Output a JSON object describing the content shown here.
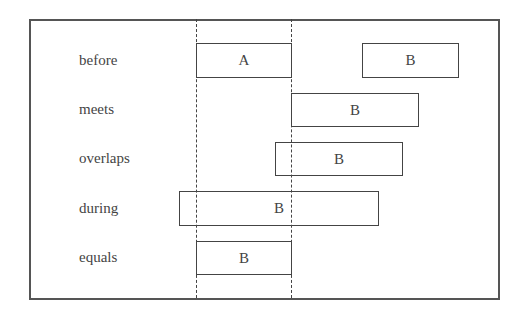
{
  "diagram": {
    "reference_interval": {
      "label": "A",
      "x_start": 196,
      "x_end": 291
    },
    "rows": [
      {
        "relation": "before",
        "boxes": [
          {
            "label": "A",
            "x": 196,
            "w": 95,
            "y": 43,
            "h": 34
          },
          {
            "label": "B",
            "x": 362,
            "w": 96,
            "y": 43,
            "h": 34
          }
        ]
      },
      {
        "relation": "meets",
        "boxes": [
          {
            "label": "B",
            "x": 291,
            "w": 127,
            "y": 93,
            "h": 33
          }
        ]
      },
      {
        "relation": "overlaps",
        "boxes": [
          {
            "label": "B",
            "x": 275,
            "w": 127,
            "y": 142,
            "h": 33
          }
        ]
      },
      {
        "relation": "during",
        "boxes": [
          {
            "label": "B",
            "x": 179,
            "w": 199,
            "y": 191,
            "h": 34
          }
        ]
      },
      {
        "relation": "equals",
        "boxes": [
          {
            "label": "B",
            "x": 196,
            "w": 95,
            "y": 241,
            "h": 33
          }
        ]
      }
    ],
    "colors": {
      "line": "#444444",
      "frame": "#555555",
      "text": "#444444",
      "background": "#ffffff"
    }
  }
}
